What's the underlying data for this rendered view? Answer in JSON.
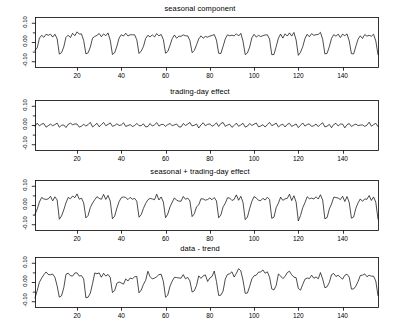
{
  "figure": {
    "background": "#ffffff",
    "line_color": "#000000",
    "axis_color": "#000000",
    "width": 400,
    "height": 332
  },
  "chart_data": [
    {
      "type": "line",
      "title": "seasonal component",
      "xlabel": "",
      "ylabel": "",
      "xlim": [
        1,
        156
      ],
      "ylim": [
        -0.13,
        0.13
      ],
      "xticks": [
        20,
        40,
        60,
        80,
        100,
        120,
        140
      ],
      "xticklabels": [
        "20",
        "40",
        "60",
        "80",
        "100",
        "120",
        "140"
      ],
      "yticks": [
        -0.1,
        0.0,
        0.1
      ],
      "yticklabels": [
        "-0.10",
        "0.00",
        "0.10"
      ],
      "yminorticks": [
        -0.05,
        0.05
      ],
      "grid": false,
      "legend": "none",
      "series": [
        {
          "name": "seasonal",
          "generator": "seasonal",
          "period": 12,
          "n": 156,
          "amplitude": 0.062,
          "noise": 0.004,
          "seed": 7,
          "profile": [
            -0.055,
            -0.022,
            0.018,
            0.034,
            0.026,
            0.038,
            0.03,
            0.041,
            0.033,
            0.04,
            0.01,
            -0.06
          ]
        }
      ]
    },
    {
      "type": "line",
      "title": "trading-day effect",
      "xlabel": "",
      "ylabel": "",
      "xlim": [
        1,
        156
      ],
      "ylim": [
        -0.13,
        0.13
      ],
      "xticks": [
        20,
        40,
        60,
        80,
        100,
        120,
        140
      ],
      "xticklabels": [
        "20",
        "40",
        "60",
        "80",
        "100",
        "120",
        "140"
      ],
      "yticks": [
        -0.1,
        0.0,
        0.1
      ],
      "yticklabels": [
        "-0.10",
        "0.00",
        "0.10"
      ],
      "yminorticks": [
        -0.05,
        0.05
      ],
      "grid": false,
      "legend": "none",
      "series": [
        {
          "name": "trading-day",
          "generator": "tradingday",
          "period": 3,
          "n": 156,
          "amplitude": 0.009,
          "noise": 0.0025,
          "seed": 23,
          "profile": []
        }
      ]
    },
    {
      "type": "line",
      "title": "seasonal + trading-day effect",
      "xlabel": "",
      "ylabel": "",
      "xlim": [
        1,
        156
      ],
      "ylim": [
        -0.13,
        0.13
      ],
      "xticks": [
        20,
        40,
        60,
        80,
        100,
        120,
        140
      ],
      "xticklabels": [
        "20",
        "40",
        "60",
        "80",
        "100",
        "120",
        "140"
      ],
      "yticks": [
        -0.1,
        0.0,
        0.1
      ],
      "yticklabels": [
        "-0.10",
        "0.00",
        "0.10"
      ],
      "yminorticks": [
        -0.05,
        0.05
      ],
      "grid": false,
      "legend": "none",
      "series": [
        {
          "name": "seasonal + trading-day",
          "generator": "sum",
          "period": 12,
          "n": 156,
          "amplitude": 0.062,
          "noise": 0.004,
          "seed": 7,
          "profile": [
            -0.055,
            -0.022,
            0.018,
            0.034,
            0.026,
            0.038,
            0.03,
            0.041,
            0.033,
            0.04,
            0.01,
            -0.06
          ]
        }
      ]
    },
    {
      "type": "line",
      "title": "data - trend",
      "xlabel": "",
      "ylabel": "",
      "xlim": [
        1,
        156
      ],
      "ylim": [
        -0.13,
        0.13
      ],
      "xticks": [
        20,
        40,
        60,
        80,
        100,
        120,
        140
      ],
      "xticklabels": [
        "20",
        "40",
        "60",
        "80",
        "100",
        "120",
        "140"
      ],
      "yticks": [
        -0.1,
        0.0,
        0.1
      ],
      "yticklabels": [
        "-0.10",
        "0.00",
        "0.10"
      ],
      "yminorticks": [
        -0.05,
        0.05
      ],
      "grid": false,
      "legend": "none",
      "series": [
        {
          "name": "data - trend",
          "generator": "datatrend",
          "period": 12,
          "n": 156,
          "amplitude": 0.058,
          "noise": 0.013,
          "seed": 41,
          "profile": [
            -0.05,
            -0.02,
            0.016,
            0.031,
            0.024,
            0.035,
            0.028,
            0.038,
            0.03,
            0.036,
            0.009,
            -0.055
          ]
        }
      ]
    }
  ],
  "panels": [
    {
      "id": "seasonal-component",
      "title": "seasonal component",
      "top": 4,
      "plot_top": 17,
      "plot_left": 35,
      "plot_width": 343,
      "plot_height": 50,
      "axis_label_top": 64
    },
    {
      "id": "trading-day-effect",
      "title": "trading-day effect",
      "top": 87,
      "plot_top": 100,
      "plot_left": 35,
      "plot_width": 343,
      "plot_height": 50,
      "axis_label_top": 147
    },
    {
      "id": "seasonal-trading-day-effect",
      "title": "seasonal + trading-day effect",
      "top": 167,
      "plot_top": 180,
      "plot_left": 35,
      "plot_width": 343,
      "plot_height": 50,
      "axis_label_top": 227
    },
    {
      "id": "data-trend",
      "title": "data - trend",
      "top": 244,
      "plot_top": 257,
      "plot_left": 35,
      "plot_width": 343,
      "plot_height": 50,
      "axis_label_top": 304
    }
  ]
}
